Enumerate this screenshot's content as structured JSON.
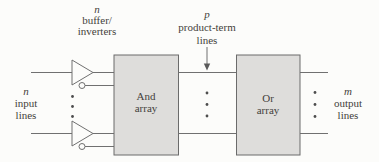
{
  "labels": {
    "buffer_inverters": {
      "count_var": "n",
      "line1": "buffer/",
      "line2": "inverters"
    },
    "product_terms": {
      "count_var": "p",
      "line1": "product-term",
      "line2": "lines"
    },
    "inputs": {
      "count_var": "n",
      "line1": "input",
      "line2": "lines"
    },
    "outputs": {
      "count_var": "m",
      "line1": "output",
      "line2": "lines"
    }
  },
  "blocks": {
    "and_array": {
      "line1": "And",
      "line2": "array"
    },
    "or_array": {
      "line1": "Or",
      "line2": "array"
    }
  },
  "colors": {
    "background": "#fcfcfa",
    "box_fill": "#dedddb",
    "line": "#707070",
    "text": "#443f3b"
  }
}
